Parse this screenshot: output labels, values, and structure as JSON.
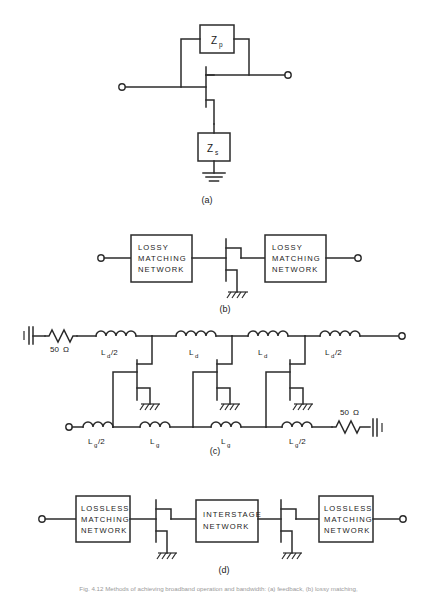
{
  "figure": {
    "background_color": "#ffffff",
    "line_color": "#2b2b2b",
    "width": 437,
    "height": 597
  },
  "panels": [
    {
      "id": "a",
      "caption": "(a)",
      "description": "FET with parallel feedback impedance Zp and series source impedance Zs to ground",
      "elements": {
        "feedback_block_label": "Z",
        "feedback_block_sub": "p",
        "source_block_label": "Z",
        "source_block_sub": "s"
      }
    },
    {
      "id": "b",
      "caption": "(b)",
      "description": "FET between two lossy matching networks",
      "blocks": [
        {
          "lines": [
            "LOSSY",
            "MATCHING",
            "NETWORK"
          ]
        },
        {
          "lines": [
            "LOSSY",
            "MATCHING",
            "NETWORK"
          ]
        }
      ]
    },
    {
      "id": "c",
      "caption": "(c)",
      "description": "Distributed (travelling-wave) amplifier with artificial gate and drain transmission lines loaded by three FETs",
      "drain_line": {
        "terminating_resistor": "50 Ω",
        "inductors": [
          "L_d/2",
          "L_d",
          "L_d",
          "L_d/2"
        ],
        "inductor_labels": [
          {
            "base": "L",
            "sub": "d",
            "suffix": "/2"
          },
          {
            "base": "L",
            "sub": "d",
            "suffix": ""
          },
          {
            "base": "L",
            "sub": "d",
            "suffix": ""
          },
          {
            "base": "L",
            "sub": "d",
            "suffix": "/2"
          }
        ]
      },
      "gate_line": {
        "terminating_resistor": "50 Ω",
        "inductors": [
          "L_g/2",
          "L_g",
          "L_g",
          "L_g/2"
        ],
        "inductor_labels": [
          {
            "base": "L",
            "sub": "g",
            "suffix": "/2"
          },
          {
            "base": "L",
            "sub": "g",
            "suffix": ""
          },
          {
            "base": "L",
            "sub": "g",
            "suffix": ""
          },
          {
            "base": "L",
            "sub": "g",
            "suffix": "/2"
          }
        ]
      },
      "device_count": 3,
      "resistor_ohm_left": "50",
      "resistor_ohm_right": "50",
      "ohm_symbol": "Ω"
    },
    {
      "id": "d",
      "caption": "(d)",
      "description": "Two FET stages with lossless matching networks at input and output and an interstage network between them",
      "blocks": [
        {
          "lines": [
            "LOSSLESS",
            "MATCHING",
            "NETWORK"
          ]
        },
        {
          "lines": [
            "INTERSTAGE",
            "NETWORK"
          ]
        },
        {
          "lines": [
            "LOSSLESS",
            "MATCHING",
            "NETWORK"
          ]
        }
      ]
    }
  ],
  "figure_caption": "Fig. 4.12 Methods of achieving broadband operation and bandwidth: (a) feedback, (b) lossy matching,"
}
